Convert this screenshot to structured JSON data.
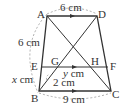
{
  "diagram": {
    "type": "trapezoid-geometry",
    "points": {
      "A": {
        "label": "A",
        "x": 47,
        "y": 16
      },
      "D": {
        "label": "D",
        "x": 97,
        "y": 16
      },
      "B": {
        "label": "B",
        "x": 39,
        "y": 91
      },
      "C": {
        "label": "C",
        "x": 111,
        "y": 91
      },
      "E": {
        "label": "E",
        "x": 41,
        "y": 67
      },
      "F": {
        "label": "F",
        "x": 108,
        "y": 67
      },
      "G": {
        "label": "G",
        "x": 56,
        "y": 67
      },
      "H": {
        "label": "H",
        "x": 93,
        "y": 67
      }
    },
    "measurements": {
      "AD": "6 cm",
      "AE": "6 cm",
      "EB": "x cm",
      "BC": "9 cm",
      "GH": "y cm",
      "BG": "2 cm"
    },
    "labels": {
      "x_var": "x",
      "y_var": "y",
      "cm": "cm",
      "six_cm_top": "6 cm",
      "six_cm_left": "6 cm",
      "nine_cm": "9 cm",
      "two_cm": "2 cm"
    }
  }
}
